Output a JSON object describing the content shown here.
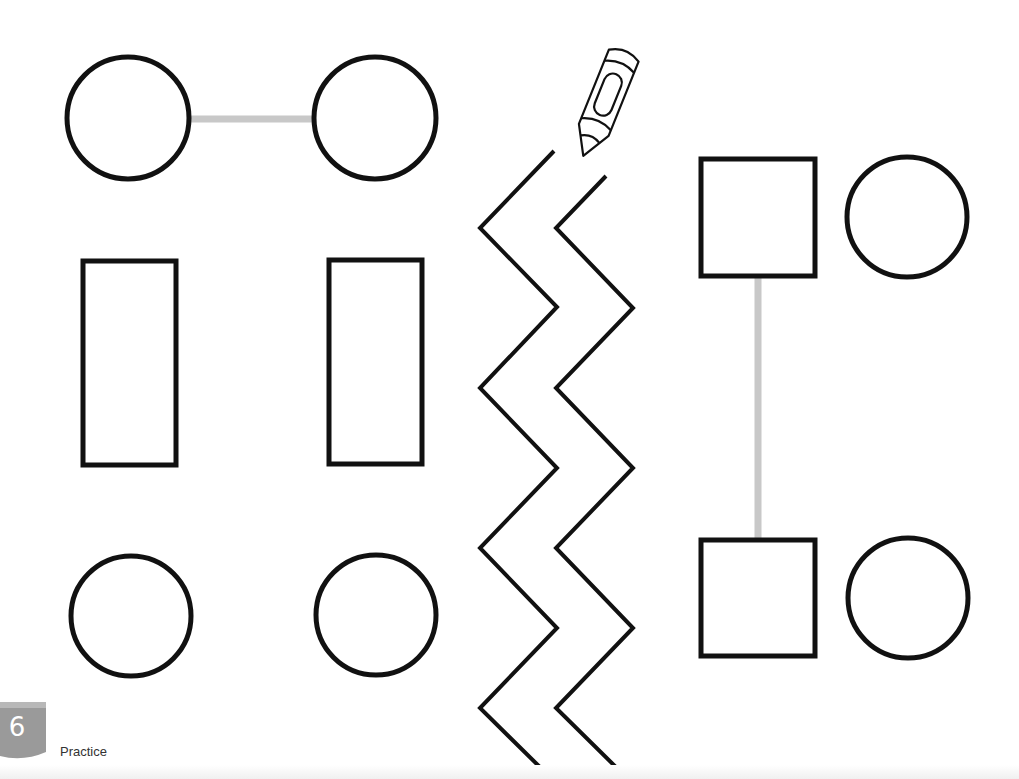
{
  "page": {
    "number": "6",
    "section_label": "Practice",
    "badge_color": "#9a9a9a",
    "stroke_color": "#111111",
    "guide_line_color": "#c8c8c8"
  },
  "shapes": {
    "top_left_circle": {
      "cx": 128,
      "cy": 118,
      "r": 61
    },
    "top_right_circle": {
      "cx": 375,
      "cy": 118,
      "r": 61
    },
    "top_connector": {
      "x1": 189,
      "y1": 119,
      "x2": 314,
      "y2": 119
    },
    "left_rectangle": {
      "x": 83,
      "y": 261,
      "w": 93,
      "h": 204
    },
    "right_rectangle": {
      "x": 329,
      "y": 260,
      "w": 93,
      "h": 204
    },
    "bottom_left_circle": {
      "cx": 131,
      "cy": 616,
      "r": 60
    },
    "bottom_right_circle": {
      "cx": 376,
      "cy": 615,
      "r": 60
    },
    "upper_square": {
      "x": 701,
      "y": 159,
      "w": 114,
      "h": 117
    },
    "upper_circle": {
      "cx": 907,
      "cy": 217,
      "r": 60
    },
    "lower_square": {
      "x": 701,
      "y": 540,
      "w": 114,
      "h": 116
    },
    "lower_circle": {
      "cx": 908,
      "cy": 598,
      "r": 60
    },
    "vertical_connector": {
      "x1": 758,
      "y1": 278,
      "x2": 758,
      "y2": 538
    }
  },
  "zigzag": {
    "left_path": "M554,151 L480,228 L557,307 L480,388 L557,468 L480,548 L557,628 L480,708 L552,779",
    "right_path": "M606,176 L556,228 L633,308 L556,388 L633,468 L556,548 L633,628 L556,708 L628,779"
  },
  "icons": {
    "crayon": "crayon-icon"
  }
}
